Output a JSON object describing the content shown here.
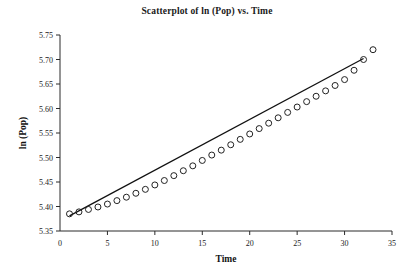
{
  "chart_data": {
    "type": "scatter",
    "title": "Scatterplot of ln (Pop) vs. Time",
    "xlabel": "Time",
    "ylabel": "ln (Pop)",
    "xlim": [
      0,
      35
    ],
    "ylim": [
      5.35,
      5.75
    ],
    "xticks": [
      0,
      5,
      10,
      15,
      20,
      25,
      30,
      35
    ],
    "xtick_labels": [
      "0",
      "5",
      "10",
      "15",
      "20",
      "25",
      "30",
      "35"
    ],
    "yticks": [
      5.35,
      5.4,
      5.45,
      5.5,
      5.55,
      5.6,
      5.65,
      5.7,
      5.75
    ],
    "ytick_labels": [
      "5.35",
      "5.40",
      "5.45",
      "5.50",
      "5.55",
      "5.60",
      "5.65",
      "5.70",
      "5.75"
    ],
    "grid": false,
    "legend": false,
    "marker": "open-circle",
    "marker_color": "#222222",
    "line_color": "#111111",
    "x": [
      1,
      2,
      3,
      4,
      5,
      6,
      7,
      8,
      9,
      10,
      11,
      12,
      13,
      14,
      15,
      16,
      17,
      18,
      19,
      20,
      21,
      22,
      23,
      24,
      25,
      26,
      27,
      28,
      29,
      30,
      31,
      32,
      33
    ],
    "y": [
      5.385,
      5.389,
      5.394,
      5.399,
      5.405,
      5.412,
      5.419,
      5.427,
      5.435,
      5.444,
      5.453,
      5.463,
      5.473,
      5.483,
      5.494,
      5.505,
      5.515,
      5.526,
      5.537,
      5.548,
      5.559,
      5.57,
      5.581,
      5.592,
      5.603,
      5.614,
      5.625,
      5.636,
      5.647,
      5.659,
      5.678,
      5.7,
      5.72
    ],
    "fit_line": {
      "name": "least-squares fit",
      "x_start": 1,
      "x_end": 32,
      "y_start": 5.381,
      "y_end": 5.702
    }
  }
}
